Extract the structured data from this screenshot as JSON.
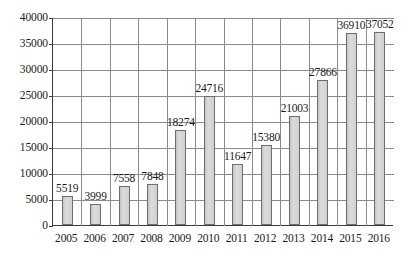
{
  "chart_data": {
    "type": "bar",
    "title": "",
    "subtitle": "",
    "xlabel": "",
    "ylabel": "",
    "categories": [
      "2005",
      "2006",
      "2007",
      "2008",
      "2009",
      "2010",
      "2011",
      "2012",
      "2013",
      "2014",
      "2015",
      "2016"
    ],
    "values": [
      5519,
      3999,
      7558,
      7848,
      18274,
      24716,
      11647,
      15380,
      21003,
      27866,
      36910,
      37052
    ],
    "data_labels": [
      "5519",
      "3999",
      "7558",
      "7848",
      "18274",
      "24716",
      "11647",
      "15380",
      "21003",
      "27866",
      "36910",
      "37052"
    ],
    "ylim": [
      0,
      40000
    ],
    "ytick_values": [
      0,
      5000,
      10000,
      15000,
      20000,
      25000,
      30000,
      35000,
      40000
    ],
    "ytick_labels": [
      "0",
      "5000",
      "10000",
      "15000",
      "20000",
      "25000",
      "30000",
      "35000",
      "40000"
    ],
    "grid": "horizontal-and-vertical",
    "legend": "none",
    "series_name": "",
    "bar_fill_color": "#d4d4d4",
    "bar_border_color": "#6e6e6e",
    "gridline_color": "#8a8a8a",
    "axis_color": "#3b3b3b",
    "text_color": "#1a1a1a",
    "background_color": "#ffffff"
  }
}
